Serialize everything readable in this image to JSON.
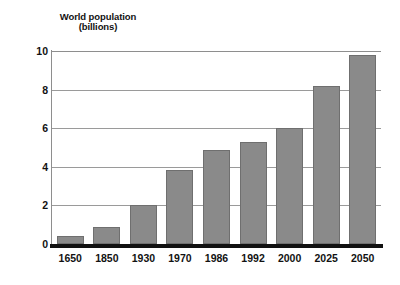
{
  "chart_data": {
    "type": "bar",
    "title": "World population (billions)",
    "title_line1": "World population",
    "title_line2": "(billions)",
    "xlabel": "",
    "ylabel": "World population (billions)",
    "categories": [
      "1650",
      "1850",
      "1930",
      "1970",
      "1986",
      "1992",
      "2000",
      "2025",
      "2050"
    ],
    "values": [
      0.4,
      0.9,
      2.0,
      3.85,
      4.85,
      5.3,
      6.0,
      8.2,
      9.8
    ],
    "ylim": [
      0,
      10
    ],
    "yticks": [
      0,
      2,
      4,
      6,
      8,
      10
    ],
    "ytick_labels": [
      "0",
      "2",
      "4",
      "6",
      "8",
      "10"
    ],
    "grid": true,
    "legend": false,
    "legend_position": "none",
    "series": [
      {
        "name": "World population",
        "values": [
          0.4,
          0.9,
          2.0,
          3.85,
          4.85,
          5.3,
          6.0,
          8.2,
          9.8
        ]
      }
    ],
    "colors": {
      "bar_fill": "#8a8a8a",
      "bar_edge": "#6f6f6f",
      "gridline": "#9a9a9a",
      "axis": "#111111",
      "background": "#ffffff",
      "text": "#121212"
    }
  }
}
